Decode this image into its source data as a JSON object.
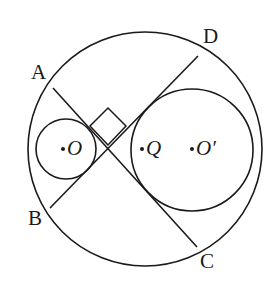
{
  "figure": {
    "background_color": "#ffffff",
    "stroke_color": "#1a1a1a",
    "label_color": "#1a1a1a",
    "width": 275,
    "height": 294
  },
  "circles": [
    {
      "name": "outer-circle",
      "cx": 145,
      "cy": 149,
      "r": 117,
      "stroke_width": 1.6
    },
    {
      "name": "small-circle-o",
      "cx": 66,
      "cy": 149,
      "r": 30,
      "stroke_width": 1.6
    },
    {
      "name": "large-inner-circle-o-prime",
      "cx": 192,
      "cy": 150,
      "r": 61,
      "stroke_width": 1.6
    }
  ],
  "chords": [
    {
      "name": "chord-a-c",
      "from": "A",
      "to": "C",
      "x1": 53,
      "y1": 88,
      "x2": 197,
      "y2": 247
    },
    {
      "name": "chord-b-d",
      "from": "B",
      "to": "D",
      "x1": 50,
      "y1": 208,
      "x2": 198,
      "y2": 56
    }
  ],
  "right_angle_mark": {
    "name": "right-angle-mark",
    "points": "108,145 90,126 108,108 126,126",
    "size": 25
  },
  "vertex_labels": [
    {
      "id": "A",
      "text": "A",
      "x": 31,
      "y": 62
    },
    {
      "id": "D",
      "text": "D",
      "x": 203,
      "y": 26
    },
    {
      "id": "B",
      "text": "B",
      "x": 28,
      "y": 208
    },
    {
      "id": "C",
      "text": "C",
      "x": 200,
      "y": 251
    }
  ],
  "center_markers": [
    {
      "id": "O",
      "dot_x": 63,
      "dot_y": 149,
      "text": "O",
      "label_x": 67,
      "label_y": 138,
      "dot_r": 2
    },
    {
      "id": "Q",
      "dot_x": 142,
      "dot_y": 149,
      "text": "Q",
      "label_x": 146,
      "label_y": 138,
      "dot_r": 2
    },
    {
      "id": "Op",
      "dot_x": 192,
      "dot_y": 149,
      "text": "O′",
      "label_x": 196,
      "label_y": 138,
      "dot_r": 2
    }
  ]
}
